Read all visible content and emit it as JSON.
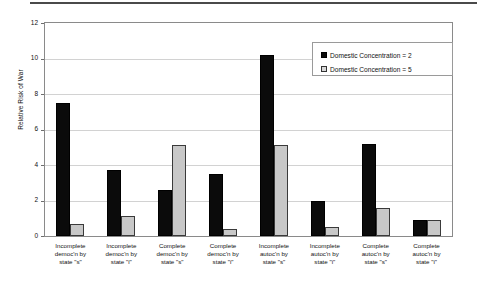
{
  "chart_data": {
    "type": "bar",
    "title": "",
    "xlabel": "",
    "ylabel": "Relative Risk of War",
    "ylim": [
      0,
      12
    ],
    "yticks": [
      0,
      2,
      4,
      6,
      8,
      10,
      12
    ],
    "grid": true,
    "legend_position": "top-right",
    "categories": [
      "Incomplete democ'n by state \"s\"",
      "Incomplete democ'n by state \"i\"",
      "Complete democ'n by state \"s\"",
      "Complete democ'n by state \"i\"",
      "Incomplete autoc'n by state \"s\"",
      "Incomplete autoc'n by state \"i\"",
      "Complete autoc'n by state \"s\"",
      "Complete autoc'n by state \"i\""
    ],
    "category_lines": [
      [
        "Incomplete",
        "democ'n by",
        "state \"s\""
      ],
      [
        "Incomplete",
        "democ'n by",
        "state \"i\""
      ],
      [
        "Complete",
        "democ'n by",
        "state \"s\""
      ],
      [
        "Complete",
        "democ'n by",
        "state \"i\""
      ],
      [
        "Incomplete",
        "autoc'n by",
        "state \"s\""
      ],
      [
        "Incomplete",
        "autoc'n by",
        "state \"i\""
      ],
      [
        "Complete",
        "autoc'n by",
        "state \"s\""
      ],
      [
        "Complete",
        "autoc'n by",
        "state \"i\""
      ]
    ],
    "series": [
      {
        "name": "Domestic  Concentration = 2",
        "color": "#0b0b0b",
        "values": [
          7.5,
          3.7,
          2.6,
          3.5,
          10.2,
          2.0,
          5.2,
          0.9
        ]
      },
      {
        "name": "Domestic  Concentration = 5",
        "color": "#c8c8c8",
        "values": [
          0.7,
          1.1,
          5.1,
          0.4,
          5.1,
          0.5,
          1.6,
          0.9
        ]
      }
    ]
  },
  "legend": {
    "items": [
      {
        "label": "Domestic  Concentration = 2",
        "swatch": "black"
      },
      {
        "label": "Domestic  Concentration = 5",
        "swatch": "gray"
      }
    ]
  }
}
